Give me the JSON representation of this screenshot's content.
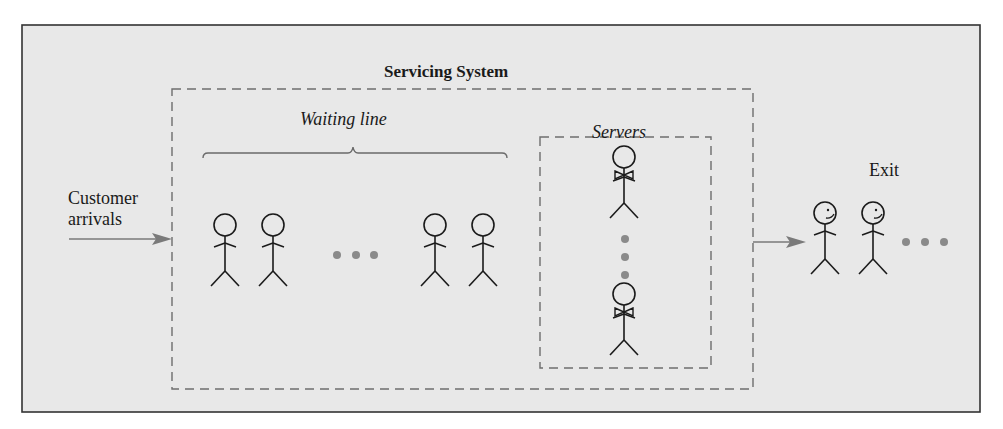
{
  "diagram": {
    "title": "Servicing System",
    "waiting_line_label": "Waiting line",
    "servers_label": "Servers",
    "arrivals_label_line1": "Customer",
    "arrivals_label_line2": "arrivals",
    "exit_label": "Exit",
    "waiting_customers_shown": 4,
    "servers_shown": 2,
    "exited_customers_shown": 2,
    "ellipsis": "• • •",
    "colors": {
      "background": "#e8e8e8",
      "frame": "#333333",
      "dashed": "#6e6e6e",
      "arrow": "#7a7a7a",
      "dots": "#8a8a8a",
      "figure": "#1a1a1a"
    }
  }
}
